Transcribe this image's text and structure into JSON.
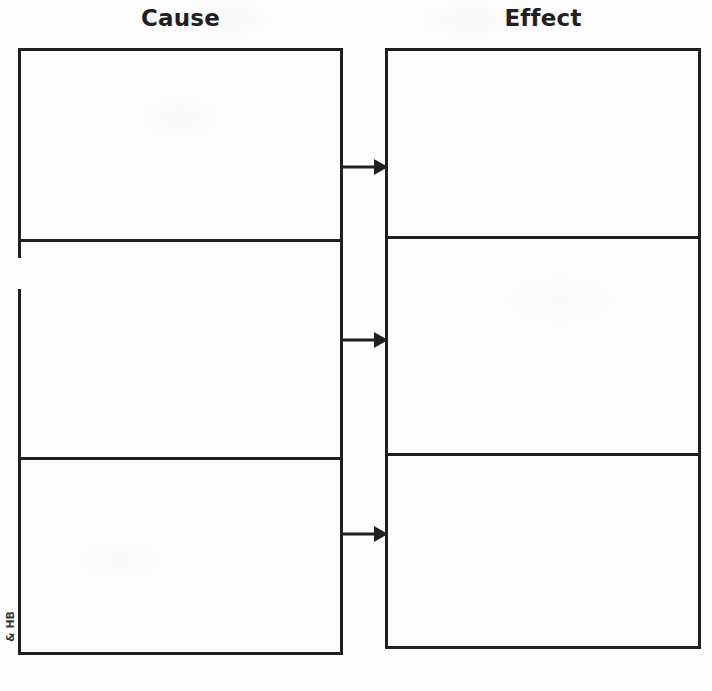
{
  "worksheet": {
    "type": "cause-and-effect-graphic-organizer",
    "background_color": "#fdfdfd",
    "ink_color": "#231f20",
    "columns": [
      {
        "id": "cause",
        "heading": "Cause",
        "cells": [
          {
            "value": ""
          },
          {
            "value": ""
          },
          {
            "value": ""
          }
        ]
      },
      {
        "id": "effect",
        "heading": "Effect",
        "cells": [
          {
            "value": ""
          },
          {
            "value": ""
          },
          {
            "value": ""
          }
        ]
      }
    ],
    "connectors": [
      {
        "name": "arrow-icon",
        "direction": "right",
        "from": "cause-cell-1",
        "to": "effect-cell-1"
      },
      {
        "name": "arrow-icon",
        "direction": "right",
        "from": "cause-cell-2",
        "to": "effect-cell-2"
      },
      {
        "name": "arrow-icon",
        "direction": "right",
        "from": "cause-cell-3",
        "to": "effect-cell-3"
      }
    ],
    "margin_credit": "& HB"
  }
}
